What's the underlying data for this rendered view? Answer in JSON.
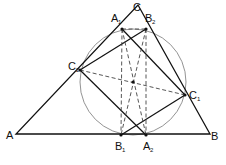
{
  "diagram": {
    "points": {
      "A": {
        "x": 16,
        "y": 134,
        "label": "A",
        "sub": ""
      },
      "B": {
        "x": 210,
        "y": 134,
        "label": "B",
        "sub": ""
      },
      "C": {
        "x": 138,
        "y": 5,
        "label": "C",
        "sub": ""
      },
      "A1": {
        "x": 122,
        "y": 29,
        "label": "A",
        "sub": "1"
      },
      "B2": {
        "x": 146,
        "y": 29,
        "label": "B",
        "sub": "2"
      },
      "C2": {
        "x": 80,
        "y": 70,
        "label": "C",
        "sub": "2"
      },
      "C1": {
        "x": 185,
        "y": 95,
        "label": "C",
        "sub": "1"
      },
      "B1": {
        "x": 121,
        "y": 135,
        "label": "B",
        "sub": "1"
      },
      "A2": {
        "x": 146,
        "y": 135,
        "label": "A",
        "sub": "2"
      },
      "O": {
        "x": 133,
        "y": 82,
        "label": "",
        "sub": ""
      }
    },
    "circle": {
      "cx": 133,
      "cy": 82,
      "r": 53
    },
    "colors": {
      "stroke": "#111111",
      "circle": "#777777",
      "dashed": "#444444",
      "background": "#ffffff"
    },
    "caption": ""
  }
}
